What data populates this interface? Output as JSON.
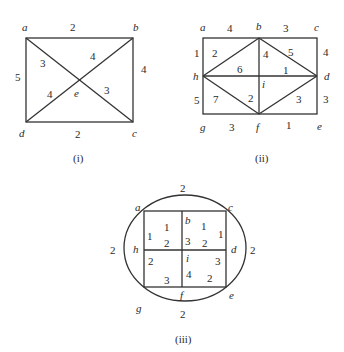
{
  "colors": {
    "line": "#333333",
    "text": "#2a2a2a",
    "background": "#ffffff"
  },
  "diagram_i": {
    "caption": "(i)",
    "vertices": {
      "a": "a",
      "b": "b",
      "c": "c",
      "d": "d",
      "e": "e"
    },
    "edges": {
      "ab": "2",
      "bc": "4",
      "dc": "2",
      "ad": "5",
      "ae": "3",
      "be": "4",
      "de": "4",
      "ec": "3"
    }
  },
  "diagram_ii": {
    "caption": "(ii)",
    "vertices": {
      "a": "a",
      "b": "b",
      "c": "c",
      "d": "d",
      "e": "e",
      "f": "f",
      "g": "g",
      "h": "h",
      "i": "i"
    },
    "edges": {
      "ab": "4",
      "bc": "3",
      "ah": "1",
      "cd": "4",
      "hg": "5",
      "de": "3",
      "gf": "3",
      "fe": "1",
      "hb": "2",
      "bi": "4",
      "bd": "5",
      "hi": "6",
      "id": "1",
      "hf": "7",
      "if": "2",
      "fd": "3"
    }
  },
  "diagram_iii": {
    "caption": "(iii)",
    "vertices": {
      "a": "a",
      "b": "b",
      "c": "c",
      "d": "d",
      "e": "e",
      "f": "f",
      "g": "g",
      "h": "h",
      "i": "i"
    },
    "edges": {
      "arc_top": "2",
      "arc_left": "2",
      "arc_right": "2",
      "arc_bottom": "2",
      "ab": "1",
      "ah": "1",
      "bi_upper": "3",
      "hi_upper": "2",
      "bc": "1",
      "cd": "1",
      "id_upper": "2",
      "hg": "2",
      "gf": "3",
      "i_f": "4",
      "de": "3",
      "fe": "2"
    }
  }
}
